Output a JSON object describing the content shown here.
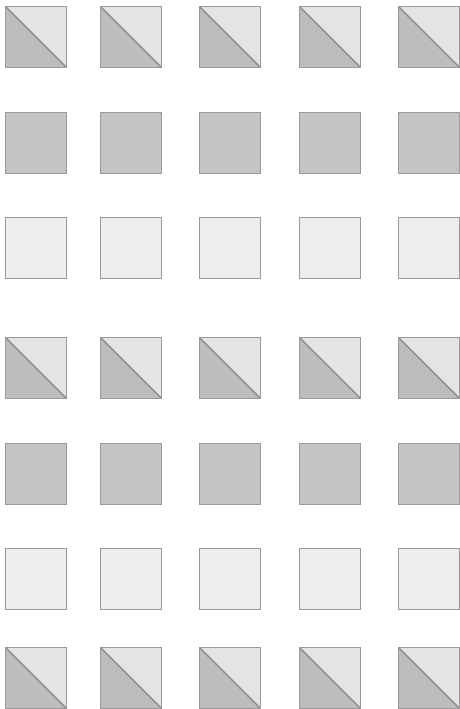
{
  "canvas": {
    "width": 460,
    "height": 708,
    "background": "#ffffff",
    "title": "Grayscale swatch grid"
  },
  "palette": {
    "border": "#9a9a9a",
    "diagonal_line": "#8f8f8f",
    "dark_gray": "#bdbdbd",
    "medium_gray": "#c4c4c4",
    "light_gray": "#ededed",
    "pale_gray": "#e4e4e4"
  },
  "grid": {
    "columns": 5,
    "rows": 7,
    "cell_size": 62,
    "column_x": [
      5,
      100,
      199,
      299,
      398
    ],
    "row_y": [
      6,
      112,
      217,
      337,
      443,
      548,
      647
    ],
    "column_step": 99,
    "row_step": 105
  },
  "row_styles": [
    {
      "index": 0,
      "name": "diagonal-split",
      "label": "Diagonal split swatch",
      "lower_left": "#bdbdbd",
      "upper_right": "#e4e4e4",
      "diagonal": "#8f8f8f"
    },
    {
      "index": 1,
      "name": "solid-medium",
      "label": "Solid medium gray swatch",
      "fill": "#c4c4c4"
    },
    {
      "index": 2,
      "name": "solid-light",
      "label": "Solid light gray swatch",
      "fill": "#ededed"
    },
    {
      "index": 3,
      "name": "diagonal-split",
      "label": "Diagonal split swatch",
      "lower_left": "#bdbdbd",
      "upper_right": "#e4e4e4",
      "diagonal": "#8f8f8f"
    },
    {
      "index": 4,
      "name": "solid-medium",
      "label": "Solid medium gray swatch",
      "fill": "#c4c4c4"
    },
    {
      "index": 5,
      "name": "solid-light",
      "label": "Solid light gray swatch",
      "fill": "#ededed"
    },
    {
      "index": 6,
      "name": "diagonal-split",
      "label": "Diagonal split swatch",
      "lower_left": "#bdbdbd",
      "upper_right": "#e4e4e4",
      "diagonal": "#8f8f8f"
    }
  ],
  "cells": [
    {
      "row": 0,
      "col": 0,
      "style": "diagonal-split"
    },
    {
      "row": 0,
      "col": 1,
      "style": "diagonal-split"
    },
    {
      "row": 0,
      "col": 2,
      "style": "diagonal-split"
    },
    {
      "row": 0,
      "col": 3,
      "style": "diagonal-split"
    },
    {
      "row": 0,
      "col": 4,
      "style": "diagonal-split"
    },
    {
      "row": 1,
      "col": 0,
      "style": "solid-medium"
    },
    {
      "row": 1,
      "col": 1,
      "style": "solid-medium"
    },
    {
      "row": 1,
      "col": 2,
      "style": "solid-medium"
    },
    {
      "row": 1,
      "col": 3,
      "style": "solid-medium"
    },
    {
      "row": 1,
      "col": 4,
      "style": "solid-medium"
    },
    {
      "row": 2,
      "col": 0,
      "style": "solid-light"
    },
    {
      "row": 2,
      "col": 1,
      "style": "solid-light"
    },
    {
      "row": 2,
      "col": 2,
      "style": "solid-light"
    },
    {
      "row": 2,
      "col": 3,
      "style": "solid-light"
    },
    {
      "row": 2,
      "col": 4,
      "style": "solid-light"
    },
    {
      "row": 3,
      "col": 0,
      "style": "diagonal-split"
    },
    {
      "row": 3,
      "col": 1,
      "style": "diagonal-split"
    },
    {
      "row": 3,
      "col": 2,
      "style": "diagonal-split"
    },
    {
      "row": 3,
      "col": 3,
      "style": "diagonal-split"
    },
    {
      "row": 3,
      "col": 4,
      "style": "diagonal-split"
    },
    {
      "row": 4,
      "col": 0,
      "style": "solid-medium"
    },
    {
      "row": 4,
      "col": 1,
      "style": "solid-medium"
    },
    {
      "row": 4,
      "col": 2,
      "style": "solid-medium"
    },
    {
      "row": 4,
      "col": 3,
      "style": "solid-medium"
    },
    {
      "row": 4,
      "col": 4,
      "style": "solid-medium"
    },
    {
      "row": 5,
      "col": 0,
      "style": "solid-light"
    },
    {
      "row": 5,
      "col": 1,
      "style": "solid-light"
    },
    {
      "row": 5,
      "col": 2,
      "style": "solid-light"
    },
    {
      "row": 5,
      "col": 3,
      "style": "solid-light"
    },
    {
      "row": 5,
      "col": 4,
      "style": "solid-light"
    },
    {
      "row": 6,
      "col": 0,
      "style": "diagonal-split"
    },
    {
      "row": 6,
      "col": 1,
      "style": "diagonal-split"
    },
    {
      "row": 6,
      "col": 2,
      "style": "diagonal-split"
    },
    {
      "row": 6,
      "col": 3,
      "style": "diagonal-split"
    },
    {
      "row": 6,
      "col": 4,
      "style": "diagonal-split"
    }
  ]
}
